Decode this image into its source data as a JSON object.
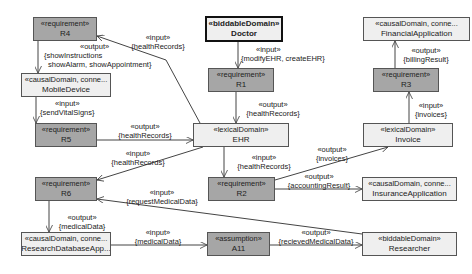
{
  "nodes": {
    "r4": {
      "stereotype": "«requirement»",
      "name": "R4"
    },
    "mobile": {
      "stereotype": "«causalDomain, conne...",
      "name": "MobileDevice"
    },
    "r5": {
      "stereotype": "«requirement»",
      "name": "R5"
    },
    "r6": {
      "stereotype": "«requirement»",
      "name": "R6"
    },
    "research_db": {
      "stereotype": "«causalDomain, conne...",
      "name": "ResearchDatabaseApp..."
    },
    "doctor": {
      "stereotype": "«biddableDomain»",
      "name": "Doctor"
    },
    "r1": {
      "stereotype": "«requirement»",
      "name": "R1"
    },
    "ehr": {
      "stereotype": "«lexicalDomain»",
      "name": "EHR"
    },
    "r2": {
      "stereotype": "«requirement»",
      "name": "R2"
    },
    "a11": {
      "stereotype": "«assumption»",
      "name": "A11"
    },
    "financial": {
      "stereotype": "«causalDomain, conne...",
      "name": "FinancialApplication"
    },
    "r3": {
      "stereotype": "«requirement»",
      "name": "R3"
    },
    "invoice": {
      "stereotype": "«lexicalDomain»",
      "name": "Invoice"
    },
    "insurance": {
      "stereotype": "«causalDomain, conne...",
      "name": "InsuranceApplication"
    },
    "researcher": {
      "stereotype": "«biddableDomain»",
      "name": "Researcher"
    }
  },
  "edges": {
    "r4_mobile": {
      "kind": "«output»",
      "l1": "{showInstructions",
      "l2": "showAlarm, showAppointment}"
    },
    "ehr_r4": {
      "kind": "«input»",
      "data": "{healthRecords}"
    },
    "mobile_r5": {
      "kind": "«input»",
      "data": "{sendVitalSigns}"
    },
    "r5_ehr": {
      "kind": "«output»",
      "data": "{healthRecords}"
    },
    "ehr_r6": {
      "kind": "«input»",
      "data": "{healthRecords}"
    },
    "doctor_r1": {
      "kind": "«input»",
      "data": "{modifyEHR, createEHR}"
    },
    "r1_ehr": {
      "kind": "«output»",
      "data": "{healthRecords}"
    },
    "ehr_r2": {
      "kind": "«input»",
      "data": "{healthRecords}"
    },
    "r2_invoice": {
      "kind": "«output»",
      "data": "{invoices}"
    },
    "r2_insurance": {
      "kind": "«output»",
      "data": "{accountingResult}"
    },
    "researcher_r6": {
      "kind": "«input»",
      "data": "{requestMedicalData}"
    },
    "r6_researchdb": {
      "kind": "«output»",
      "data": "{medicalData}"
    },
    "researchdb_a11": {
      "kind": "«input»",
      "data": "{medicalData}"
    },
    "a11_researcher": {
      "kind": "«output»",
      "data": "{recievedMedicalData}"
    },
    "invoice_r3": {
      "kind": "«input»",
      "data": "{invoices}"
    },
    "r3_financial": {
      "kind": "«output»",
      "data": "{billingResult}"
    }
  },
  "colors": {
    "requirement_fill": "#a6a6a6",
    "domain_fill": "#efefef",
    "line": "#444444"
  }
}
